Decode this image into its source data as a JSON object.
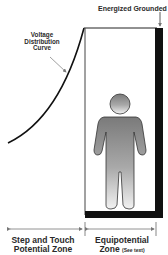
{
  "diagram": {
    "top_label": "Energized Grounded Object",
    "curve_label": [
      "Voltage",
      "Distribution",
      "Curve"
    ],
    "zones": {
      "left": {
        "line1": "Step and Touch",
        "line2": "Potential Zone"
      },
      "right": {
        "line1": "Equipotential",
        "line2": "Zone",
        "note": "(See text)"
      }
    },
    "colors": {
      "line": "#222222",
      "energized_object": "#111111",
      "person_fill_top": "#7a7a7a",
      "person_fill_bottom": "#f2f2f2",
      "arrow": "#777777"
    }
  }
}
